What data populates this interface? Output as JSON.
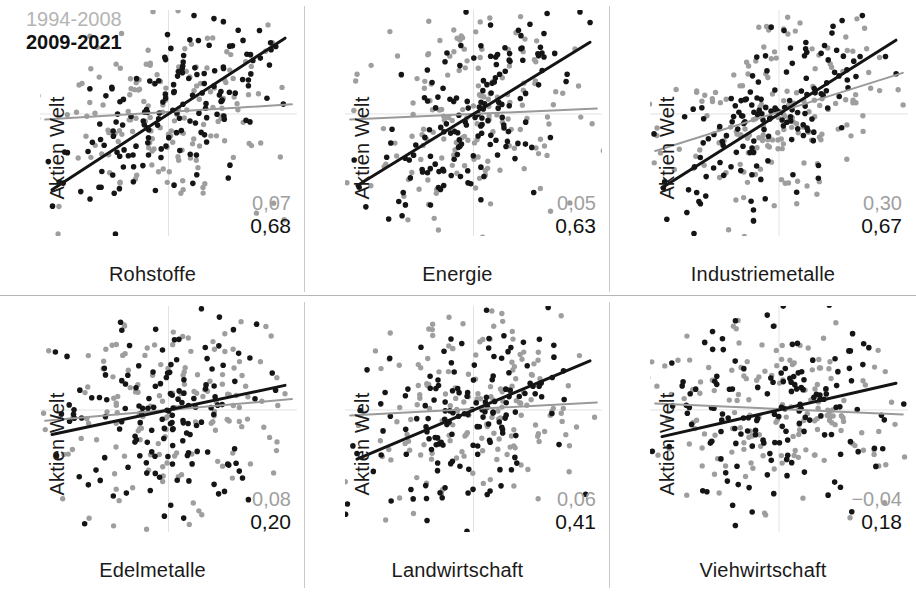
{
  "legend": {
    "old_period": "1994-2008",
    "new_period": "2009-2021",
    "old_color": "#b4b4b4",
    "new_color": "#111111"
  },
  "axis": {
    "y_label": "Aktien Welt"
  },
  "chart_data": {
    "type": "scatter",
    "title": "",
    "layout": {
      "rows": 2,
      "cols": 3,
      "grid": true,
      "legend_position": "top-left-first-panel"
    },
    "xlim": [
      -1,
      1
    ],
    "ylim": [
      -1,
      1
    ],
    "ylabel": "Aktien Welt",
    "series_names": [
      "1994-2008",
      "2009-2021"
    ],
    "series_colors": [
      "#9e9e9e",
      "#151515"
    ],
    "panels": [
      {
        "xlabel": "Rohstoffe",
        "corr_old": "0,07",
        "corr_new": "0,68",
        "corr_old_value": 0.07,
        "corr_new_value": 0.68,
        "old_line": {
          "slope": 0.07,
          "intercept": 0.02
        },
        "new_line": {
          "slope": 0.74,
          "intercept": 0.0
        },
        "n_old": 168,
        "n_new": 156
      },
      {
        "xlabel": "Energie",
        "corr_old": "0,05",
        "corr_new": "0,63",
        "corr_old_value": 0.05,
        "corr_new_value": 0.63,
        "old_line": {
          "slope": 0.05,
          "intercept": 0.0
        },
        "new_line": {
          "slope": 0.7,
          "intercept": 0.0
        },
        "n_old": 168,
        "n_new": 156
      },
      {
        "xlabel": "Industriemetalle",
        "corr_old": "0,30",
        "corr_new": "0,67",
        "corr_old_value": 0.3,
        "corr_new_value": 0.67,
        "old_line": {
          "slope": 0.36,
          "intercept": 0.02
        },
        "new_line": {
          "slope": 0.72,
          "intercept": 0.0
        },
        "n_old": 168,
        "n_new": 156
      },
      {
        "xlabel": "Edelmetalle",
        "corr_old": "0,08",
        "corr_new": "0,20",
        "corr_old_value": 0.08,
        "corr_new_value": 0.2,
        "old_line": {
          "slope": 0.1,
          "intercept": 0.0
        },
        "new_line": {
          "slope": 0.24,
          "intercept": 0.0
        },
        "n_old": 168,
        "n_new": 156
      },
      {
        "xlabel": "Landwirtschaft",
        "corr_old": "0,06",
        "corr_new": "0,41",
        "corr_old_value": 0.06,
        "corr_new_value": 0.41,
        "old_line": {
          "slope": 0.06,
          "intercept": 0.01
        },
        "new_line": {
          "slope": 0.48,
          "intercept": 0.0
        },
        "n_old": 168,
        "n_new": 156
      },
      {
        "xlabel": "Viehwirtschaft",
        "corr_old": "−0,04",
        "corr_new": "0,18",
        "corr_old_value": -0.04,
        "corr_new_value": 0.18,
        "old_line": {
          "slope": -0.05,
          "intercept": 0.01
        },
        "new_line": {
          "slope": 0.26,
          "intercept": 0.0
        },
        "n_old": 168,
        "n_new": 156
      }
    ]
  }
}
